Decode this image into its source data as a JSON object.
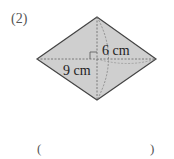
{
  "problem": {
    "number_label": "(2)",
    "shape": "rhombus",
    "diagonal_half_vertical_label": "6 cm",
    "diagonal_half_horizontal_label": "9 cm",
    "fill_color": "#cfcfcf",
    "edge_color": "#444444",
    "right_angle_marker": true
  },
  "answer": {
    "open_paren": "(",
    "close_paren": ")",
    "value": ""
  }
}
